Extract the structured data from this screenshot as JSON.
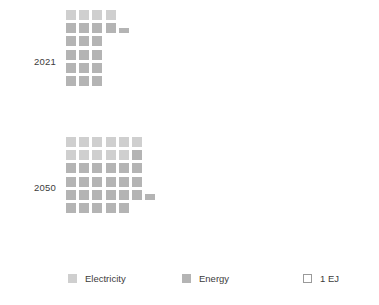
{
  "chart_data": {
    "type": "waffle",
    "title": "",
    "subtitle": "",
    "xlabel": "",
    "ylabel": "",
    "unit_label": "1 EJ",
    "unit_value": 1,
    "grid": false,
    "legend_position": "bottom",
    "categories": [
      "2021",
      "2050"
    ],
    "series": [
      {
        "name": "Electricity",
        "color": "#cfcfcf",
        "values": [
          4,
          11
        ]
      },
      {
        "name": "Energy",
        "color": "#b4b4b4",
        "values": [
          15.5,
          22.5
        ]
      }
    ],
    "groups": [
      {
        "label": "2021",
        "columns": 4,
        "rows": 6,
        "total_squares": 19,
        "full_squares": 19,
        "partial_squares": 1,
        "electricity_squares": 4,
        "energy_squares": 15.5,
        "row_counts_bottom_up": [
          3,
          3,
          3,
          3,
          4,
          4
        ],
        "notes": "row 5 from bottom ends in a partial (half-height) square"
      },
      {
        "label": "2050",
        "columns": 6,
        "rows": 6,
        "total_squares": 34,
        "full_squares": 34,
        "partial_squares": 1,
        "electricity_squares": 11,
        "energy_squares": 22.5,
        "row_counts_bottom_up": [
          5,
          6,
          6,
          6,
          6,
          6
        ],
        "notes": "row 2 from bottom ends in a partial (half-height) square"
      }
    ]
  },
  "years": {
    "y2021": "2021",
    "y2050": "2050"
  },
  "legend": {
    "items": [
      {
        "label": "Electricity",
        "swatch": "filled",
        "color": "#cfcfcf"
      },
      {
        "label": "Energy",
        "swatch": "filled",
        "color": "#b4b4b4"
      },
      {
        "label": "1 EJ",
        "swatch": "outline",
        "color": "#9a9a9a"
      }
    ]
  },
  "colors": {
    "electricity": "#cfcfcf",
    "energy": "#b4b4b4",
    "outline": "#9a9a9a",
    "text": "#3c3c3c",
    "background": "#ffffff"
  }
}
